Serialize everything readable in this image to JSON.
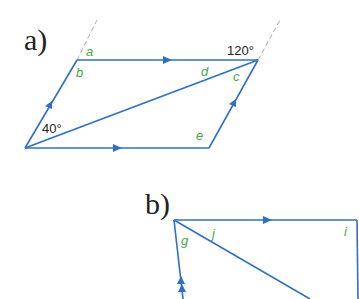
{
  "colors": {
    "line": "#2f6fc4",
    "angle_letter": "#4aa84a",
    "text": "#222222",
    "dashed": "#b0a8b8"
  },
  "part_a": {
    "label": "a)",
    "angles": {
      "a": "a",
      "b": "b",
      "c": "c",
      "d": "d",
      "e": "e"
    },
    "given_top_right": "120°",
    "given_bottom_left": "40°"
  },
  "part_b": {
    "label": "b)",
    "angles": {
      "g": "g",
      "j": "j",
      "i": "i"
    }
  }
}
